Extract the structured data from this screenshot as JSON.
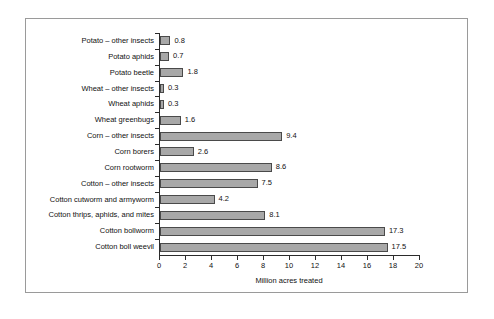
{
  "chart_data": {
    "type": "bar",
    "orientation": "horizontal",
    "title": "",
    "xlabel": "Million acres treated",
    "ylabel": "",
    "xlim": [
      0,
      20
    ],
    "xticks": [
      0,
      2,
      4,
      6,
      8,
      10,
      12,
      14,
      16,
      18,
      20
    ],
    "grid": false,
    "legend": false,
    "bar_fill_color": "#a8a8a8",
    "bar_border_color": "#4a4a4a",
    "axis_color": "#2b2b2b",
    "frame_color": "#9a9a9a",
    "categories": [
      "Potato – other insects",
      "Potato aphids",
      "Potato beetle",
      "Wheat – other insects",
      "Wheat aphids",
      "Wheat greenbugs",
      "Corn – other insects",
      "Corn borers",
      "Corn rootworm",
      "Cotton – other insects",
      "Cotton cutworm and armyworm",
      "Cotton thrips, aphids, and mites",
      "Cotton bollworm",
      "Cotton boll weevil"
    ],
    "values": [
      0.8,
      0.7,
      1.8,
      0.3,
      0.3,
      1.6,
      9.4,
      2.6,
      8.6,
      7.5,
      4.2,
      8.1,
      17.3,
      17.5
    ],
    "value_labels": [
      "0.8",
      "0.7",
      "1.8",
      "0.3",
      "0.3",
      "1.6",
      "9.4",
      "2.6",
      "8.6",
      "7.5",
      "4.2",
      "8.1",
      "17.3",
      "17.5"
    ],
    "xtick_labels": [
      "0",
      "2",
      "4",
      "6",
      "8",
      "10",
      "12",
      "14",
      "16",
      "18",
      "20"
    ]
  }
}
